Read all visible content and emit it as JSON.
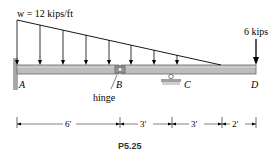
{
  "diagram": {
    "load_label": "w = 12 kips/ft",
    "point_load_label": "6 kips",
    "points": {
      "A": "A",
      "B": "B",
      "C": "C",
      "D": "D"
    },
    "hinge_label": "hinge",
    "dimensions": [
      "6′",
      "3′",
      "3′",
      "2′"
    ],
    "caption": "P5.25",
    "colors": {
      "beam_fill": "#b9b9b9",
      "beam_stroke": "#6a6a6a",
      "wall": "#a8a8a8",
      "line": "#000000"
    }
  }
}
